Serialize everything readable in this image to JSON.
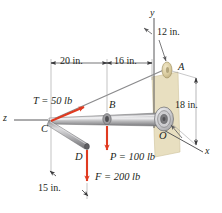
{
  "figure": {
    "type": "engineering-statics-free-body-diagram",
    "colors": {
      "force_arrow": "#e03a20",
      "line": "#58585a",
      "label_text": "#231f20",
      "wall_panel": "#e8dfc0",
      "shaft_body": "#b9b9bb",
      "shaft_highlight": "#e6e6e8",
      "shaft_dark": "#7d7d80",
      "point_A_fill": "#ded2a8",
      "bearing_outer": "#d8d8da",
      "bearing_inner": "#6e6e71"
    }
  },
  "axes": [
    {
      "name": "y-axis",
      "label": "y"
    },
    {
      "name": "x-axis",
      "label": "x"
    },
    {
      "name": "z-axis",
      "label": "z"
    }
  ],
  "points": [
    {
      "name": "point-A",
      "label": "A",
      "description": "cable anchor eyelet"
    },
    {
      "name": "point-B",
      "label": "B",
      "description": "collar on shaft where P acts"
    },
    {
      "name": "point-C",
      "label": "C",
      "description": "free end of shaft, cable and rod junction"
    },
    {
      "name": "point-D",
      "label": "D",
      "description": "end of diagonal rod where F acts"
    },
    {
      "name": "point-O",
      "label": "O",
      "description": "bearing support at wall"
    }
  ],
  "dimensions": [
    {
      "name": "dim-12in",
      "label": "12 in.",
      "description": "offset from y-axis to A"
    },
    {
      "name": "dim-20in",
      "label": "20 in.",
      "description": "from C to B"
    },
    {
      "name": "dim-16in",
      "label": "16 in.",
      "description": "from B to y-axis"
    },
    {
      "name": "dim-18in",
      "label": "18 in.",
      "description": "height of A above O"
    },
    {
      "name": "dim-15in",
      "label": "15 in.",
      "description": "horizontal offset to D"
    }
  ],
  "forces": [
    {
      "name": "force-T",
      "label": "T = 50 lb",
      "symbol": "T",
      "magnitude": 50,
      "unit": "lb",
      "applied_at": "C",
      "direction": "along cable C to A"
    },
    {
      "name": "force-P",
      "label": "P = 100 lb",
      "symbol": "P",
      "magnitude": 100,
      "unit": "lb",
      "applied_at": "B",
      "direction": "downward"
    },
    {
      "name": "force-F",
      "label": "F = 200 lb",
      "symbol": "F",
      "magnitude": 200,
      "unit": "lb",
      "applied_at": "D",
      "direction": "downward"
    }
  ]
}
